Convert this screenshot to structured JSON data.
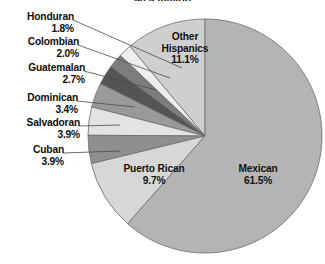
{
  "chart_data": {
    "type": "pie",
    "title": "50.5 million",
    "title_clipped": true,
    "xlabel": "",
    "ylabel": "",
    "legend_position": "none",
    "grid": false,
    "start_angle_deg": 0,
    "direction": "counterclockwise",
    "units": "percent",
    "categories": [
      "Other Hispanics",
      "Honduran",
      "Colombian",
      "Guatemalan",
      "Dominican",
      "Salvadoran",
      "Cuban",
      "Puerto Rican",
      "Mexican"
    ],
    "values": [
      11.1,
      1.8,
      2.0,
      2.7,
      3.4,
      3.9,
      3.9,
      9.7,
      61.5
    ],
    "slices": [
      {
        "label": "Other Hispanics",
        "value": 11.1,
        "pct_text": "11.1%",
        "color": "#cfcfcf",
        "label_placement": "inside"
      },
      {
        "label": "Honduran",
        "value": 1.8,
        "pct_text": "1.8%",
        "color": "#ededed",
        "label_placement": "outside"
      },
      {
        "label": "Colombian",
        "value": 2.0,
        "pct_text": "2.0%",
        "color": "#7d7d7d",
        "label_placement": "outside"
      },
      {
        "label": "Guatemalan",
        "value": 2.7,
        "pct_text": "2.7%",
        "color": "#545454",
        "label_placement": "outside"
      },
      {
        "label": "Dominican",
        "value": 3.4,
        "pct_text": "3.4%",
        "color": "#9a9a9a",
        "label_placement": "outside"
      },
      {
        "label": "Salvadoran",
        "value": 3.9,
        "pct_text": "3.9%",
        "color": "#e3e3e3",
        "label_placement": "outside"
      },
      {
        "label": "Cuban",
        "value": 3.9,
        "pct_text": "3.9%",
        "color": "#8f8f8f",
        "label_placement": "outside"
      },
      {
        "label": "Puerto Rican",
        "value": 9.7,
        "pct_text": "9.7%",
        "color": "#d7d7d7",
        "label_placement": "inside"
      },
      {
        "label": "Mexican",
        "value": 61.5,
        "pct_text": "61.5%",
        "color": "#b4b4b4",
        "label_placement": "inside"
      }
    ]
  },
  "labels": {
    "honduran": {
      "name": "Honduran",
      "pct": "1.8%"
    },
    "colombian": {
      "name": "Colombian",
      "pct": "2.0%"
    },
    "guatemalan": {
      "name": "Guatemalan",
      "pct": "2.7%"
    },
    "dominican": {
      "name": "Dominican",
      "pct": "3.4%"
    },
    "salvadoran": {
      "name": "Salvadoran",
      "pct": "3.9%"
    },
    "cuban": {
      "name": "Cuban",
      "pct": "3.9%"
    },
    "puerto_rican": {
      "name": "Puerto Rican",
      "pct": "9.7%"
    },
    "mexican": {
      "name": "Mexican",
      "pct": "61.5%"
    },
    "other_hispanics": {
      "name_line1": "Other",
      "name_line2": "Hispanics",
      "pct": "11.1%"
    }
  },
  "colors": {
    "background": "#ffffff",
    "stroke": "#6b6b6b",
    "leader_line": "#4a4a4a",
    "text": "#0d0d0d"
  }
}
